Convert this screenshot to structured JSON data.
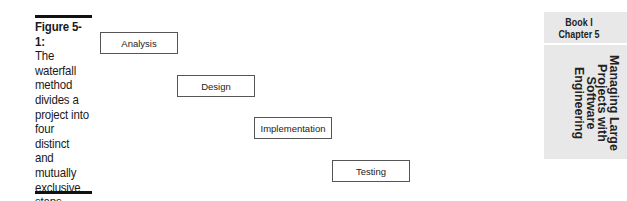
{
  "figure": {
    "label": "Figure 5-1:",
    "caption": "The waterfall method divides a project into four distinct and mutually exclusive steps."
  },
  "diagram": {
    "type": "waterfall",
    "steps": [
      {
        "label": "Analysis"
      },
      {
        "label": "Design"
      },
      {
        "label": "Implementation"
      },
      {
        "label": "Testing"
      }
    ]
  },
  "sidebar": {
    "book": "Book I",
    "chapter": "Chapter 5",
    "title_lines": [
      "Managing Large",
      "Projects with",
      "Software",
      "Engineering"
    ]
  }
}
